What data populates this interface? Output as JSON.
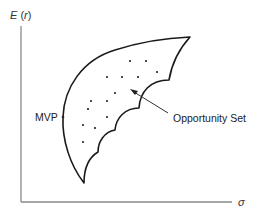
{
  "diagram": {
    "y_axis": {
      "label_prefix": "E",
      "label_open": " (",
      "label_var": "r",
      "label_close": ")"
    },
    "x_axis": {
      "label": "σ"
    },
    "labels": {
      "mvp": "MVP",
      "opportunity_set": "Opportunity Set"
    },
    "colors": {
      "axis": "#8a8a8a",
      "boundary": "#1a1a1a",
      "text": "#222222"
    },
    "points": [
      [
        130,
        61
      ],
      [
        146,
        61
      ],
      [
        157,
        72
      ],
      [
        107,
        77
      ],
      [
        122,
        77
      ],
      [
        138,
        77
      ],
      [
        115,
        93
      ],
      [
        91,
        101
      ],
      [
        107,
        101
      ],
      [
        88,
        109
      ],
      [
        107,
        117
      ],
      [
        83,
        125
      ],
      [
        95,
        128
      ],
      [
        83,
        142
      ]
    ]
  }
}
